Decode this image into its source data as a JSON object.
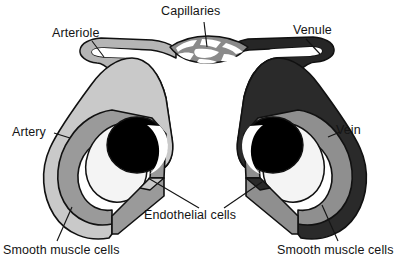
{
  "figure": {
    "background_color": "#ffffff",
    "labels": {
      "capillaries": "Capillaries",
      "arteriole": "Arteriole",
      "venule": "Venule",
      "artery": "Artery",
      "vein": "Vein",
      "endothelial_cells": "Endothelial cells",
      "smooth_muscle_cells_left": "Smooth muscle cells",
      "smooth_muscle_cells_right": "Smooth muscle cells"
    },
    "colors": {
      "outline": "#111111",
      "text": "#141414",
      "artery_adventitia": "#c9c9c9",
      "artery_muscle": "#9a9a9a",
      "arteriole_wall": "#b5b5b5",
      "vein_adventitia": "#2a2a2a",
      "vein_muscle": "#8f8f8f",
      "venule_wall": "#262626",
      "lumen": "#000000",
      "endothelium": "#f4f4f4",
      "capillary_channel": "#ffffff",
      "capillary_wall": "#8a8a8a"
    },
    "structures": [
      {
        "name": "arteriole",
        "side": "left",
        "description": "light gray tube with white interior channel curving from capillary bed down to artery"
      },
      {
        "name": "artery",
        "side": "left",
        "description": "cutaway cross-section: light gray adventitia, thick medium gray smooth muscle layer, white endothelial ring, black lumen"
      },
      {
        "name": "capillaries",
        "side": "center",
        "description": "mesh network of white channels with gray walls bridging arteriole and venule"
      },
      {
        "name": "venule",
        "side": "right",
        "description": "dark gray tube with white interior channel curving from capillary bed down to vein"
      },
      {
        "name": "vein",
        "side": "right",
        "description": "cutaway cross-section: dark near-black adventitia, medium gray smooth muscle layer, white endothelial ring, black lumen"
      }
    ],
    "leader_lines": [
      {
        "label": "capillaries",
        "targets": 1
      },
      {
        "label": "arteriole",
        "targets": 1
      },
      {
        "label": "venule",
        "targets": 1
      },
      {
        "label": "artery",
        "targets": 1
      },
      {
        "label": "vein",
        "targets": 1
      },
      {
        "label": "endothelial_cells",
        "targets": 2
      },
      {
        "label": "smooth_muscle_cells_left",
        "targets": 1
      },
      {
        "label": "smooth_muscle_cells_right",
        "targets": 1
      }
    ]
  }
}
